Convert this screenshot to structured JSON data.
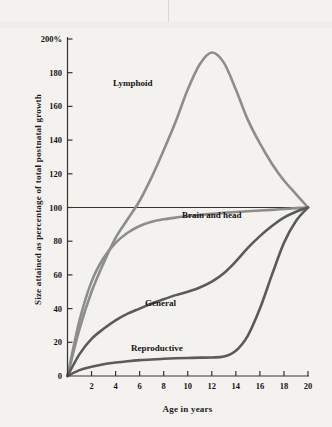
{
  "figure": {
    "background_color": "#f3f2ef",
    "axis_color": "#38342c",
    "text_color": "#16150f"
  },
  "axes": {
    "y_title": "Size attained as percentage of total postnatal growth",
    "x_title": "Age in years",
    "y_ticks": [
      {
        "value": 0,
        "label": "0"
      },
      {
        "value": 20,
        "label": "20"
      },
      {
        "value": 40,
        "label": "40"
      },
      {
        "value": 60,
        "label": "60"
      },
      {
        "value": 80,
        "label": "80"
      },
      {
        "value": 100,
        "label": "100"
      },
      {
        "value": 120,
        "label": "120"
      },
      {
        "value": 140,
        "label": "140"
      },
      {
        "value": 160,
        "label": "160"
      },
      {
        "value": 180,
        "label": "180"
      },
      {
        "value": 200,
        "label": "200%"
      }
    ],
    "x_ticks": [
      {
        "value": 2,
        "label": "2"
      },
      {
        "value": 4,
        "label": "4"
      },
      {
        "value": 6,
        "label": "6"
      },
      {
        "value": 8,
        "label": "8"
      },
      {
        "value": 10,
        "label": "10"
      },
      {
        "value": 12,
        "label": "12"
      },
      {
        "value": 14,
        "label": "14"
      },
      {
        "value": 16,
        "label": "16"
      },
      {
        "value": 18,
        "label": "18"
      },
      {
        "value": 20,
        "label": "20"
      }
    ]
  },
  "curve_labels": {
    "lymphoid": "Lymphoid",
    "brain": "Brain and head",
    "general": "General",
    "reproductive": "Reproductive"
  },
  "chart_data": {
    "type": "line",
    "title": "",
    "xlabel": "Age in years",
    "ylabel": "Size attained as percentage of total postnatal growth",
    "xlim": [
      0,
      20
    ],
    "ylim": [
      0,
      200
    ],
    "grid": false,
    "legend": "inline-labels",
    "x": [
      0,
      1,
      2,
      3,
      4,
      5,
      6,
      7,
      8,
      9,
      10,
      11,
      12,
      13,
      14,
      15,
      16,
      17,
      18,
      19,
      20
    ],
    "series": [
      {
        "name": "Lymphoid",
        "color": "#8d8d8d",
        "label_position": {
          "x": 5.6,
          "y": 172
        },
        "values": [
          0,
          28,
          50,
          67,
          82,
          93,
          104,
          118,
          134,
          151,
          170,
          185,
          192,
          186,
          170,
          152,
          138,
          126,
          116,
          108,
          100
        ]
      },
      {
        "name": "Brain and head",
        "color": "#8d8d8d",
        "label_position": {
          "x": 13.0,
          "y": 95
        },
        "values": [
          0,
          33,
          56,
          70,
          79,
          85,
          89,
          91.5,
          93,
          94,
          95,
          95.6,
          96.2,
          96.8,
          97.3,
          97.8,
          98.2,
          98.6,
          99.1,
          99.6,
          100
        ]
      },
      {
        "name": "General",
        "color": "#5b5b5b",
        "label_position": {
          "x": 8.6,
          "y": 44
        },
        "values": [
          0,
          13,
          22,
          28,
          33,
          37,
          40,
          43,
          45.5,
          48,
          50,
          52.5,
          56,
          61,
          68,
          76,
          83,
          89,
          94,
          97.5,
          100
        ]
      },
      {
        "name": "Reproductive",
        "color": "#5b5b5b",
        "label_position": {
          "x": 7.2,
          "y": 17
        },
        "values": [
          0,
          3.5,
          5.5,
          7,
          8,
          8.8,
          9.4,
          9.8,
          10.2,
          10.5,
          10.7,
          10.9,
          11,
          11.5,
          15,
          24,
          40,
          60,
          79,
          92,
          100
        ]
      }
    ],
    "reference_line": {
      "y": 100,
      "color": "#38342c",
      "from_x": 0,
      "to_x": 20
    }
  }
}
